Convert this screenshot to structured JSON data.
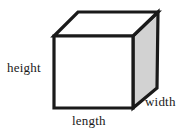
{
  "figure": {
    "type": "geometry-diagram",
    "background_color": "#ffffff"
  },
  "labels": {
    "height": "height",
    "length": "length",
    "width": "width"
  },
  "colors": {
    "outline": "#1a1a1a",
    "front_face": "#ffffff",
    "top_face": "#ffffff",
    "right_face": "#d2d2d2",
    "text": "#1a1a1a"
  },
  "geometry": {
    "front_top_left": [
      54,
      36
    ],
    "front_top_right": [
      133,
      36
    ],
    "front_bottom_left": [
      54,
      108
    ],
    "front_bottom_right": [
      133,
      108
    ],
    "back_top_left": [
      78,
      12
    ],
    "back_top_right": [
      158,
      12
    ],
    "back_bottom_right": [
      157,
      88
    ],
    "stroke_width": 3.2
  }
}
